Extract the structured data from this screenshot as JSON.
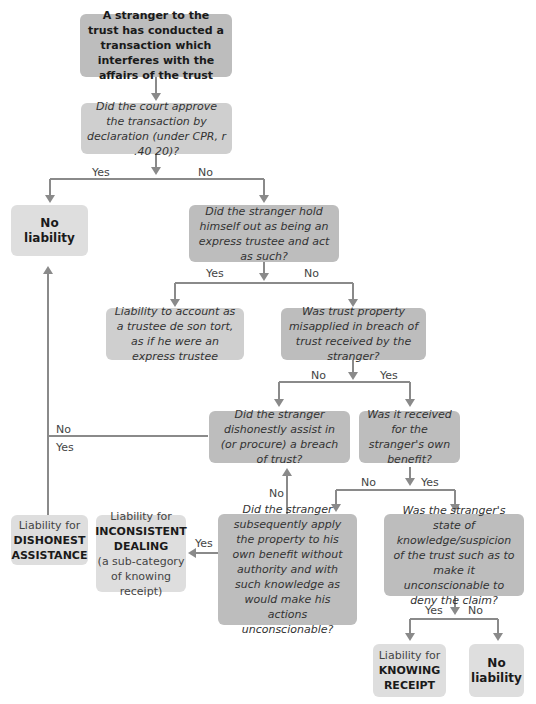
{
  "diagram": {
    "start": "A stranger to the trust has conducted a transaction which interferes with the affairs of the trust",
    "q1": "Did the court approve the transaction by declaration (under CPR, r .40 20)?",
    "q2": "Did the stranger hold himself out as being an express trustee and act as such?",
    "outcome_trustee": "Liability to account as a trustee de son tort, as if he were an express trustee",
    "q3": "Was trust property misapplied in breach of trust received by the stranger?",
    "q4": "Did the stranger dishonestly assist in (or procure) a breach of trust?",
    "q5": "Was it received for the stranger's own benefit?",
    "q6": "Did the stranger subsequently apply the property to his own benefit without authority and with such knowledge as would make his actions unconscionable?",
    "q7": "Was the stranger's state of knowledge/suspicion of the trust such as to make it unconscionable to deny the claim?",
    "no_liability_1": "No liability",
    "no_liability_2": "No liability",
    "dishonest": {
      "prefix": "Liability for",
      "strong": "DISHONEST ASSISTANCE"
    },
    "inconsistent": {
      "prefix": "Liability for",
      "strong": "INCONSISTENT DEALING",
      "note": "(a sub-category of knowing receipt)"
    },
    "knowing": {
      "prefix": "Liability for",
      "strong": "KNOWING RECEIPT"
    },
    "labels": {
      "yes": "Yes",
      "no": "No"
    },
    "colors": {
      "question_box": "#bdbdbd",
      "outcome_box": "#dedede",
      "arrow": "#8a8a8a"
    }
  }
}
